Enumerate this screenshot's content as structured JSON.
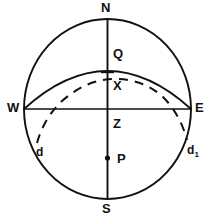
{
  "figure": {
    "kind": "celestial-sphere-diagram",
    "background_color": "#ffffff",
    "stroke_color": "#111111",
    "width": 215,
    "height": 220
  },
  "labels": {
    "north": "N",
    "south": "S",
    "west": "W",
    "east": "E",
    "zenith_point": "Z",
    "equator_point": "Q",
    "cross_point": "X",
    "pole_point": "P",
    "arc_left": "d",
    "arc_right_base": "d",
    "arc_right_subscript": "1"
  },
  "elements": {
    "circle": {
      "name": "celestial-meridian-circle",
      "center_x": 107.5,
      "center_y": 109,
      "radius_x": 83.5,
      "radius_y": 90,
      "style": "solid"
    },
    "vertical_axis": {
      "name": "north-south-axis",
      "x": 107.5,
      "y_top": 19,
      "y_bottom": 199,
      "style": "solid"
    },
    "horizontal_axis": {
      "name": "west-east-axis",
      "y": 109,
      "x_left": 24,
      "x_right": 191,
      "style": "solid"
    },
    "solid_arc": {
      "name": "celestial-equator-arc",
      "from_x": 24,
      "from_y": 109,
      "to_x": 191,
      "to_y": 109,
      "apex_x": 107.5,
      "apex_y": 71,
      "style": "solid"
    },
    "dashed_arc": {
      "name": "diurnal-circle-dashed-arc",
      "from_x": 37,
      "from_y": 142,
      "to_x": 187,
      "to_y": 141,
      "apex_x": 110,
      "apex_y": 76,
      "style": "dashed"
    },
    "point_p": {
      "name": "point-p-marker",
      "x": 107.5,
      "y": 158,
      "style": "filled-dot"
    },
    "tick_x": {
      "name": "x-intersection-tick",
      "x": 107.5,
      "y": 72
    }
  }
}
